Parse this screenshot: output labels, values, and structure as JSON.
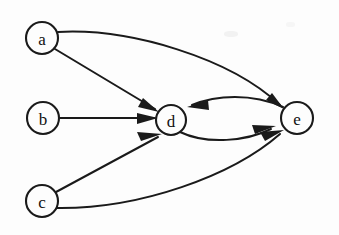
{
  "figure": {
    "background_color": "#fdfdfd",
    "stroke_color": "#1a1a1a",
    "label_color": "#111111",
    "width": 339,
    "height": 235
  },
  "graph": {
    "type": "directed-graph",
    "node_radius": 16,
    "nodes": [
      {
        "id": "a",
        "label": "a",
        "cx": 42,
        "cy": 38,
        "r": 16
      },
      {
        "id": "b",
        "label": "b",
        "cx": 43,
        "cy": 118,
        "r": 16
      },
      {
        "id": "c",
        "label": "c",
        "cx": 42,
        "cy": 201,
        "r": 16
      },
      {
        "id": "d",
        "label": "d",
        "cx": 171,
        "cy": 120,
        "r": 15
      },
      {
        "id": "e",
        "label": "e",
        "cx": 297,
        "cy": 118,
        "r": 16
      }
    ],
    "edges": [
      {
        "id": "a-e",
        "from": "a",
        "to": "e",
        "style": "curved-up",
        "path": "M 58 32 C 130 28 230 58 280 105",
        "arrow": {
          "x": 282,
          "y": 107,
          "angle": 42
        }
      },
      {
        "id": "a-d",
        "from": "a",
        "to": "d",
        "style": "straight",
        "path": "M 55 49 L 156 110",
        "arrow": {
          "x": 157,
          "y": 111,
          "angle": 31
        }
      },
      {
        "id": "b-d",
        "from": "b",
        "to": "d",
        "style": "straight",
        "path": "M 59 118 L 155 118",
        "arrow": {
          "x": 157,
          "y": 118,
          "angle": 0
        }
      },
      {
        "id": "c-d",
        "from": "c",
        "to": "d",
        "style": "straight",
        "path": "M 56 192 L 159 136",
        "arrow": {
          "x": 161,
          "y": 135,
          "angle": -28
        }
      },
      {
        "id": "c-e",
        "from": "c",
        "to": "e",
        "style": "curved-down",
        "path": "M 57 208 C 140 208 230 175 281 132",
        "arrow": {
          "x": 283,
          "y": 130,
          "angle": -40
        }
      },
      {
        "id": "e-d",
        "from": "e",
        "to": "d",
        "style": "curved-upper-arc",
        "path": "M 283 108 C 250 96 215 98 190 106",
        "arrow": {
          "x": 188,
          "y": 107,
          "angle": 165
        }
      },
      {
        "id": "d-e",
        "from": "d",
        "to": "e",
        "style": "curved-lower-arc",
        "path": "M 180 132 C 205 143 245 140 272 128",
        "arrow": {
          "x": 274,
          "y": 127,
          "angle": -24
        }
      }
    ]
  }
}
